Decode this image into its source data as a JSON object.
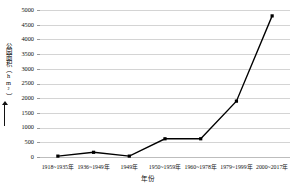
{
  "chart_data": {
    "type": "line",
    "title": "",
    "xlabel": "年份",
    "ylabel": "公园面积（hm²）",
    "categories": [
      "1918~1935年",
      "1936~1949年",
      "1949年",
      "1950~1959年",
      "1960~1978年",
      "1979~1999年",
      "2000~2017年"
    ],
    "values": [
      30,
      160,
      30,
      620,
      620,
      1900,
      4800
    ],
    "ylim": [
      0,
      5000
    ],
    "yticks": [
      0,
      500,
      1000,
      1500,
      2000,
      2500,
      3000,
      3500,
      4000,
      4500,
      5000
    ],
    "ytick_labels": [
      "0",
      "500",
      "1000",
      "1500",
      "2000",
      "2500",
      "3000",
      "3500",
      "4000",
      "4500",
      "5000"
    ],
    "grid": true,
    "legend": "none",
    "series_color": "#000000",
    "grid_color": "#d4d4d4",
    "marker": "square"
  }
}
